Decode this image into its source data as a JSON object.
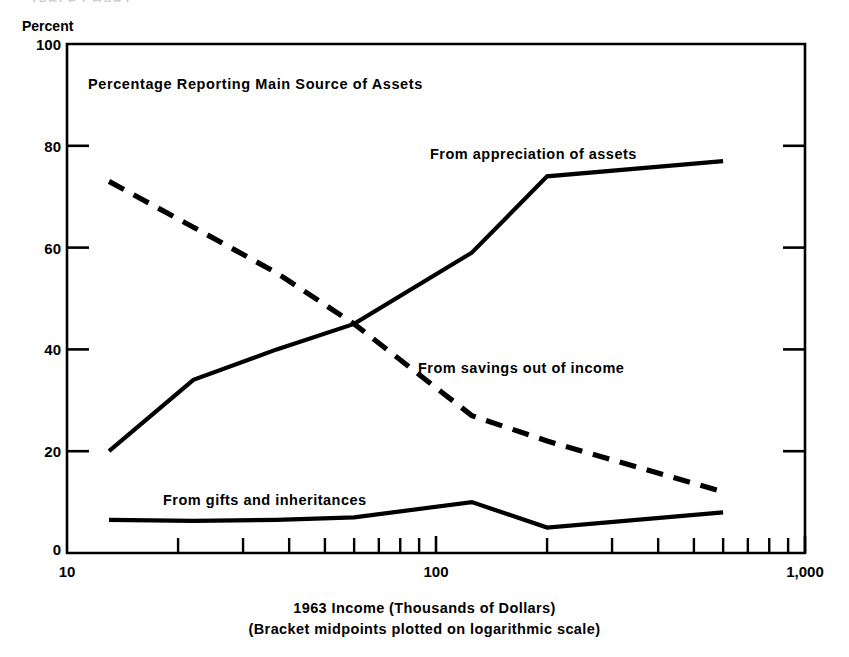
{
  "figure": {
    "cropped_header_fragment": "TABLE   CHART",
    "plot_title": "Percentage Reporting Main Source of Assets",
    "y_axis_unit": "Percent",
    "caption_line1": "1963 Income (Thousands of Dollars)",
    "caption_line2": "(Bracket midpoints plotted on logarithmic scale)"
  },
  "chart_data": {
    "type": "line",
    "title": "Percentage Reporting Main Source of Assets",
    "xlabel": "1963 Income (Thousands of Dollars)",
    "xlabel_note": "(Bracket midpoints plotted on logarithmic scale)",
    "ylabel": "Percent",
    "xscale": "log",
    "xlim": [
      10,
      1000
    ],
    "ylim": [
      0,
      100
    ],
    "grid": false,
    "legend": "inline-annotations",
    "x_ticks_major": [
      10,
      100,
      1000
    ],
    "x_tick_labels": [
      "10",
      "100",
      "1,000"
    ],
    "x_ticks_minor": [
      20,
      30,
      40,
      50,
      60,
      70,
      80,
      90,
      200,
      300,
      400,
      500,
      600,
      700,
      800,
      900
    ],
    "y_ticks": [
      0,
      20,
      40,
      60,
      80,
      100
    ],
    "y_tick_labels": [
      "0",
      "20",
      "40",
      "60",
      "80",
      "100"
    ],
    "x": [
      13,
      22,
      37,
      60,
      125,
      200,
      600
    ],
    "series": [
      {
        "name": "From appreciation of assets",
        "style": "solid",
        "values": [
          20,
          34,
          40,
          45,
          59,
          74,
          77
        ]
      },
      {
        "name": "From savings out of income",
        "style": "dashed",
        "values": [
          73,
          64,
          55,
          45,
          27,
          22,
          12
        ]
      },
      {
        "name": "From gifts and inheritances",
        "style": "solid",
        "values": [
          6.5,
          6.3,
          6.5,
          7,
          10,
          5,
          8
        ]
      }
    ]
  },
  "colors": {
    "ink": "#000000",
    "background": "#ffffff"
  }
}
